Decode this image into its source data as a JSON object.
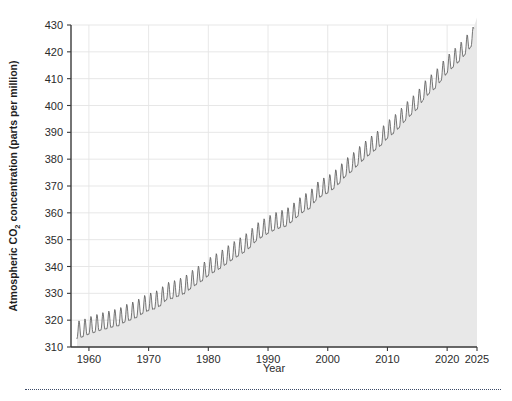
{
  "figure": {
    "background_color": "#ffffff",
    "plot_area_background": "#ffffff",
    "area_fill_color": "#e8e8e8",
    "line_color": "#555555",
    "grid_color": "#e4e4e4",
    "axis_color": "#3a3a3a",
    "separator_color": "#3b4a66"
  },
  "chart_data": {
    "type": "area",
    "title": "",
    "subtitle": "",
    "xlabel": "Year",
    "ylabel": "Atmospheric CO2 concentration (parts per million)",
    "ylabel_parts": {
      "before": "Atmospheric CO",
      "subscript": "2",
      "after": " concentration (parts per million)"
    },
    "xlim": [
      1957.0,
      2025.0
    ],
    "ylim": [
      310,
      430
    ],
    "grid": true,
    "legend": "none",
    "x_ticks": [
      1960,
      1970,
      1980,
      1990,
      2000,
      2010,
      2020,
      2025
    ],
    "x_tick_labels": [
      "1960",
      "1970",
      "1980",
      "1990",
      "2000",
      "2010",
      "2020",
      "2025"
    ],
    "y_ticks": [
      310,
      320,
      330,
      340,
      350,
      360,
      370,
      380,
      390,
      400,
      410,
      420,
      430
    ],
    "y_tick_labels": [
      "310",
      "320",
      "330",
      "340",
      "350",
      "360",
      "370",
      "380",
      "390",
      "400",
      "410",
      "420",
      "430"
    ],
    "seasonal_amplitude_ppm": 3.1,
    "series": [
      {
        "name": "Mauna Loa monthly mean CO2",
        "x": [
          1958,
          1959,
          1960,
          1961,
          1962,
          1963,
          1964,
          1965,
          1966,
          1967,
          1968,
          1969,
          1970,
          1971,
          1972,
          1973,
          1974,
          1975,
          1976,
          1977,
          1978,
          1979,
          1980,
          1981,
          1982,
          1983,
          1984,
          1985,
          1986,
          1987,
          1988,
          1989,
          1990,
          1991,
          1992,
          1993,
          1994,
          1995,
          1996,
          1997,
          1998,
          1999,
          2000,
          2001,
          2002,
          2003,
          2004,
          2005,
          2006,
          2007,
          2008,
          2009,
          2010,
          2011,
          2012,
          2013,
          2014,
          2015,
          2016,
          2017,
          2018,
          2019,
          2020,
          2021,
          2022,
          2023,
          2024
        ],
        "values": [
          315.3,
          315.9,
          316.9,
          317.6,
          318.4,
          318.9,
          319.6,
          320.0,
          321.4,
          322.2,
          323.1,
          324.6,
          325.7,
          326.3,
          327.5,
          329.7,
          330.2,
          331.1,
          332.0,
          333.8,
          335.4,
          336.8,
          338.7,
          340.1,
          341.4,
          343.0,
          344.6,
          346.0,
          347.4,
          349.2,
          351.6,
          353.1,
          354.4,
          355.6,
          356.5,
          357.1,
          358.8,
          360.8,
          362.6,
          363.7,
          366.7,
          368.4,
          369.5,
          371.1,
          373.2,
          375.8,
          377.5,
          379.8,
          381.9,
          383.8,
          385.6,
          387.4,
          389.9,
          391.7,
          393.9,
          396.5,
          398.7,
          400.8,
          404.2,
          406.6,
          408.5,
          411.4,
          414.2,
          416.4,
          418.5,
          421.1,
          424.0
        ]
      }
    ],
    "annotations": []
  }
}
